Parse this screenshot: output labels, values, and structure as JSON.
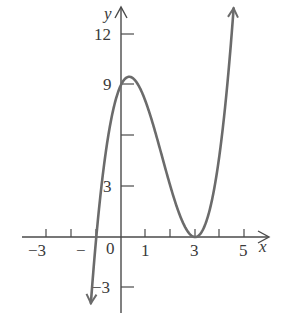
{
  "chart_data": {
    "type": "line",
    "title": "",
    "xlabel": "x",
    "ylabel": "y",
    "function": "(x+1)(x-3)^2",
    "xlim": [
      -4.4,
      6
    ],
    "ylim": [
      -4.5,
      14
    ],
    "x_ticks": [
      -4,
      -3,
      -2,
      -1,
      1,
      2,
      3,
      4,
      5
    ],
    "x_tick_labels": [
      {
        "value": -3,
        "label": "−3"
      },
      {
        "value": -1,
        "label": "−1"
      },
      {
        "value": 0,
        "label": "0"
      },
      {
        "value": 1,
        "label": "1"
      },
      {
        "value": 3,
        "label": "3"
      },
      {
        "value": 5,
        "label": "5"
      }
    ],
    "y_ticks": [
      -3,
      3,
      6,
      9,
      12
    ],
    "y_tick_labels": [
      {
        "value": 12,
        "label": "12"
      },
      {
        "value": 9,
        "label": "9"
      },
      {
        "value": 3,
        "label": "3"
      },
      {
        "value": -3,
        "label": "−3"
      }
    ],
    "key_points": [
      {
        "x": -1,
        "y": 0,
        "note": "x-intercept"
      },
      {
        "x": 0,
        "y": 9,
        "note": "y-intercept"
      },
      {
        "x": 0.333,
        "y": 9.48,
        "note": "local maximum"
      },
      {
        "x": 3,
        "y": 0,
        "note": "local minimum / double root"
      }
    ],
    "series": [
      {
        "name": "f(x)",
        "x": [
          -1.25,
          -1,
          -0.5,
          0,
          0.333,
          0.5,
          1,
          1.5,
          2,
          2.5,
          3,
          3.5,
          4,
          4.5,
          4.57
        ],
        "values": [
          -4.75,
          0,
          6.13,
          9,
          9.48,
          9.38,
          8,
          5.63,
          3,
          0.88,
          0,
          1.13,
          5,
          12.38,
          13.7
        ]
      }
    ],
    "grid": false,
    "legend": "none",
    "arrows": "both curve ends and positive axes have arrowheads"
  },
  "labels": {
    "x_axis": "x",
    "y_axis": "y",
    "x_neg3": "−3",
    "x_neg1": "−",
    "x_0": "0",
    "x_1": "1",
    "x_3": "3",
    "x_5": "5",
    "y_12": "12",
    "y_9": "9",
    "y_3": "3",
    "y_neg3": "−3"
  },
  "colors": {
    "axis": "#4a4a4a",
    "curve": "#6b6b6b",
    "text": "#3a3a3a"
  }
}
